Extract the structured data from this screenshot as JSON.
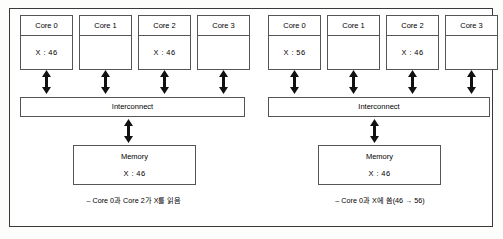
{
  "diagram": {
    "panels": [
      {
        "id": "before",
        "cores": [
          {
            "title": "Core 0",
            "value": "X : 46"
          },
          {
            "title": "Core 1",
            "value": ""
          },
          {
            "title": "Core 2",
            "value": "X : 46"
          },
          {
            "title": "Core 3",
            "value": ""
          }
        ],
        "interconnect_label": "Interconnect",
        "memory": {
          "title": "Memory",
          "value": "X : 46"
        },
        "caption": "– Core 0과 Core 2가 X를 읽음"
      },
      {
        "id": "after",
        "cores": [
          {
            "title": "Core 0",
            "value": "X : 56"
          },
          {
            "title": "Core 1",
            "value": ""
          },
          {
            "title": "Core 2",
            "value": "X : 46"
          },
          {
            "title": "Core 3",
            "value": ""
          }
        ],
        "interconnect_label": "Interconnect",
        "memory": {
          "title": "Memory",
          "value": "X : 46"
        },
        "caption": "– Core 0과 X에 씀(46 → 56)"
      }
    ],
    "icons": {
      "core_link_arrow": "double-headed-vertical-arrow",
      "memory_link_arrow": "double-headed-vertical-arrow"
    },
    "colors": {
      "stroke": "#555555",
      "frame": "#3a3a3a",
      "background": "#ffffff",
      "text": "#000000"
    }
  }
}
